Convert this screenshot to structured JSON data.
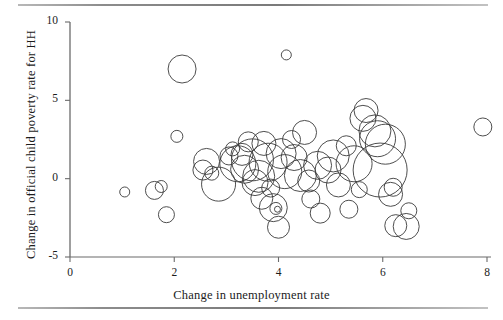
{
  "chart_data": {
    "type": "scatter",
    "title": "",
    "xlabel": "Change in unemployment rate",
    "ylabel": "Change in official child poverty rate for HH",
    "xlim": [
      -0.2,
      8.3
    ],
    "ylim": [
      -5.6,
      10.4
    ],
    "xticks": [
      0,
      2,
      4,
      6,
      8
    ],
    "xtick_labels": [
      "0",
      "2",
      "4",
      "6",
      "8"
    ],
    "yticks": [
      -5,
      0,
      5,
      10
    ],
    "ytick_labels": [
      "-5",
      "0",
      "5",
      "10"
    ],
    "grid": false,
    "legend": false,
    "marker": "open-circle",
    "marker_color": "#3a3a3a",
    "marker_fill": "none",
    "size_encoding": "bubble area (population weight)",
    "points": [
      {
        "x": 2.15,
        "y": 7.0,
        "r": 14
      },
      {
        "x": 4.15,
        "y": 7.9,
        "r": 5
      },
      {
        "x": 2.05,
        "y": 2.7,
        "r": 6
      },
      {
        "x": 1.05,
        "y": -0.85,
        "r": 5
      },
      {
        "x": 1.75,
        "y": -0.5,
        "r": 6
      },
      {
        "x": 1.62,
        "y": -0.75,
        "r": 9
      },
      {
        "x": 1.85,
        "y": -2.3,
        "r": 8
      },
      {
        "x": 2.55,
        "y": 0.55,
        "r": 10
      },
      {
        "x": 2.62,
        "y": 1.1,
        "r": 13
      },
      {
        "x": 2.72,
        "y": 0.35,
        "r": 7
      },
      {
        "x": 2.85,
        "y": -0.35,
        "r": 17
      },
      {
        "x": 3.05,
        "y": 1.45,
        "r": 9
      },
      {
        "x": 3.12,
        "y": 1.9,
        "r": 7
      },
      {
        "x": 3.22,
        "y": 0.95,
        "r": 18
      },
      {
        "x": 3.3,
        "y": 1.55,
        "r": 11
      },
      {
        "x": 3.35,
        "y": 0.6,
        "r": 14
      },
      {
        "x": 3.42,
        "y": 2.35,
        "r": 10
      },
      {
        "x": 3.5,
        "y": 1.2,
        "r": 21
      },
      {
        "x": 3.55,
        "y": -0.25,
        "r": 13
      },
      {
        "x": 3.62,
        "y": 0.15,
        "r": 16
      },
      {
        "x": 3.68,
        "y": -1.25,
        "r": 11
      },
      {
        "x": 3.72,
        "y": 2.25,
        "r": 12
      },
      {
        "x": 3.8,
        "y": 1.05,
        "r": 19
      },
      {
        "x": 3.85,
        "y": -0.6,
        "r": 9
      },
      {
        "x": 3.9,
        "y": -1.85,
        "r": 14
      },
      {
        "x": 3.95,
        "y": -1.9,
        "r": 6
      },
      {
        "x": 3.98,
        "y": -1.95,
        "r": 3
      },
      {
        "x": 4.0,
        "y": -3.1,
        "r": 11
      },
      {
        "x": 4.05,
        "y": 1.6,
        "r": 15
      },
      {
        "x": 4.12,
        "y": 0.45,
        "r": 17
      },
      {
        "x": 4.25,
        "y": 2.5,
        "r": 9
      },
      {
        "x": 4.3,
        "y": 1.35,
        "r": 13
      },
      {
        "x": 4.42,
        "y": 0.2,
        "r": 16
      },
      {
        "x": 4.5,
        "y": 2.95,
        "r": 12
      },
      {
        "x": 4.58,
        "y": -0.15,
        "r": 11
      },
      {
        "x": 4.62,
        "y": -1.3,
        "r": 9
      },
      {
        "x": 4.75,
        "y": 0.85,
        "r": 14
      },
      {
        "x": 4.8,
        "y": -2.2,
        "r": 10
      },
      {
        "x": 4.95,
        "y": 0.55,
        "r": 13
      },
      {
        "x": 5.05,
        "y": 1.45,
        "r": 16
      },
      {
        "x": 5.15,
        "y": -0.4,
        "r": 12
      },
      {
        "x": 5.3,
        "y": 2.1,
        "r": 10
      },
      {
        "x": 5.35,
        "y": -1.95,
        "r": 9
      },
      {
        "x": 5.45,
        "y": 0.95,
        "r": 18
      },
      {
        "x": 5.55,
        "y": -0.7,
        "r": 8
      },
      {
        "x": 5.62,
        "y": 3.85,
        "r": 13
      },
      {
        "x": 5.68,
        "y": 4.35,
        "r": 12
      },
      {
        "x": 5.85,
        "y": 3.05,
        "r": 16
      },
      {
        "x": 5.9,
        "y": 2.55,
        "r": 18
      },
      {
        "x": 5.95,
        "y": 0.55,
        "r": 27
      },
      {
        "x": 6.05,
        "y": 2.2,
        "r": 20
      },
      {
        "x": 6.15,
        "y": -1.0,
        "r": 12
      },
      {
        "x": 6.2,
        "y": -0.55,
        "r": 9
      },
      {
        "x": 6.25,
        "y": -3.0,
        "r": 11
      },
      {
        "x": 6.45,
        "y": -3.05,
        "r": 13
      },
      {
        "x": 6.5,
        "y": -2.05,
        "r": 8
      },
      {
        "x": 7.92,
        "y": 3.3,
        "r": 9
      }
    ]
  },
  "axis": {
    "x_title": "Change in unemployment rate",
    "y_title": "Change in official child poverty rate for HH"
  }
}
